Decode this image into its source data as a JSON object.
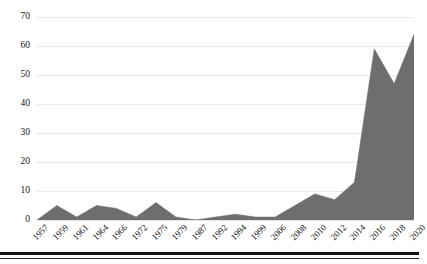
{
  "chart_data": {
    "type": "area",
    "title": "",
    "subtitle": "",
    "xlabel": "",
    "ylabel": "",
    "categories": [
      "1957",
      "1959",
      "1961",
      "1964",
      "1966",
      "1972",
      "1975",
      "1979",
      "1987",
      "1992",
      "1994",
      "1999",
      "2006",
      "2008",
      "2010",
      "2012",
      "2014",
      "2016",
      "2018",
      "2020"
    ],
    "values": [
      0,
      5,
      1,
      5,
      4,
      1,
      6,
      1,
      0,
      1,
      2,
      1,
      1,
      5,
      9,
      7,
      13,
      59,
      47,
      64
    ],
    "series": [
      {
        "name": "Count",
        "values": [
          0,
          5,
          1,
          5,
          4,
          1,
          6,
          1,
          0,
          1,
          2,
          1,
          1,
          5,
          9,
          7,
          13,
          59,
          47,
          64
        ]
      }
    ],
    "ylim": [
      0,
      70
    ],
    "yticks": [
      0,
      10,
      20,
      30,
      40,
      50,
      60,
      70
    ],
    "ytick_labels": [
      "0",
      "10",
      "20",
      "30",
      "40",
      "50",
      "60",
      "70"
    ],
    "grid": true,
    "legend": false,
    "legend_position": "none",
    "fill_color": "#6e6e6e",
    "gridline_color": "#e9e9e9",
    "axis_text_color": "#161616",
    "background_color": "#ffffff",
    "xtick_rotation": -45
  }
}
